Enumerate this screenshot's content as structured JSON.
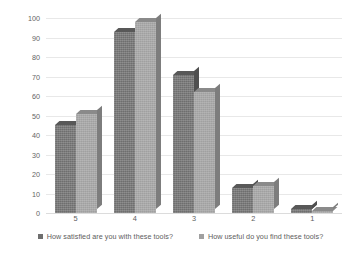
{
  "chart_data": {
    "type": "bar",
    "title": "",
    "subtitle": "",
    "xlabel": "",
    "ylabel": "",
    "categories": [
      "5",
      "4",
      "3",
      "2",
      "1"
    ],
    "ylim": [
      0,
      100
    ],
    "yticks": [
      0,
      10,
      20,
      30,
      40,
      50,
      60,
      70,
      80,
      90,
      100
    ],
    "grid": true,
    "legend_position": "bottom",
    "style": "3d-clustered-column",
    "series": [
      {
        "name": "How satisfied are you with these tools?",
        "color": "#6e6e6e",
        "values": [
          45,
          93,
          71,
          13,
          2
        ]
      },
      {
        "name": "How useful do you find these tools?",
        "color": "#a0a0a0",
        "values": [
          51,
          98,
          62,
          14,
          1
        ]
      }
    ]
  },
  "legend": {
    "items": [
      {
        "label": "How satisfied are you with these tools?",
        "marker": "square-swatch-dark"
      },
      {
        "label": "How useful do you find these tools?",
        "marker": "square-swatch-light"
      }
    ]
  },
  "axes": {
    "y_tick_labels": [
      "100",
      "90",
      "80",
      "70",
      "60",
      "50",
      "40",
      "30",
      "20",
      "10",
      "0"
    ],
    "x_tick_labels": [
      "5",
      "4",
      "3",
      "2",
      "1"
    ]
  }
}
